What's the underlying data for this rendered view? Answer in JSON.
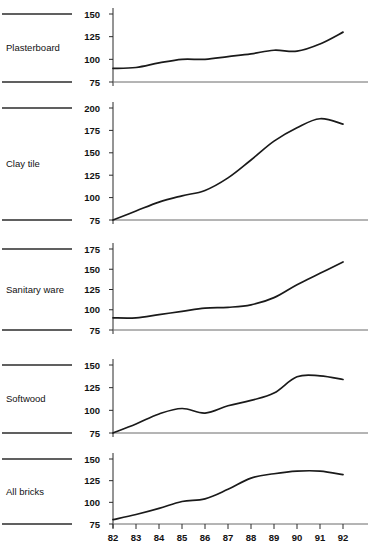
{
  "figure": {
    "background": "#ffffff",
    "line_color": "#1a1a1a",
    "axis_color": "#2b2b2b"
  },
  "axis": {
    "year_ticks": [
      "82",
      "83",
      "84",
      "85",
      "86",
      "87",
      "88",
      "89",
      "90",
      "91",
      "92"
    ]
  },
  "panels": [
    {
      "label": "Plasterboard",
      "yticks": [
        "150",
        "125",
        "100",
        "75"
      ],
      "ymin": 75,
      "ymax": 155
    },
    {
      "label": "Clay tile",
      "yticks": [
        "200",
        "175",
        "150",
        "125",
        "100",
        "75"
      ],
      "ymin": 75,
      "ymax": 205
    },
    {
      "label": "Sanitary ware",
      "yticks": [
        "175",
        "150",
        "125",
        "100",
        "75"
      ],
      "ymin": 75,
      "ymax": 180
    },
    {
      "label": "Softwood",
      "yticks": [
        "150",
        "125",
        "100",
        "75"
      ],
      "ymin": 75,
      "ymax": 155
    },
    {
      "label": "All bricks",
      "yticks": [
        "150",
        "125",
        "100",
        "75"
      ],
      "ymin": 75,
      "ymax": 155
    }
  ],
  "chart_data": {
    "type": "line",
    "title": "",
    "xlabel": "",
    "ylabel": "",
    "grid": false,
    "legend_position": "none",
    "x": [
      82,
      83,
      84,
      85,
      86,
      87,
      88,
      89,
      90,
      91,
      92
    ],
    "panels": [
      {
        "title": "Plasterboard",
        "ylabel": "",
        "ylim": [
          75,
          155
        ],
        "yticks": [
          75,
          100,
          125,
          150
        ],
        "values": [
          90,
          91,
          96,
          100,
          100,
          103,
          106,
          110,
          109,
          117,
          130
        ]
      },
      {
        "title": "Clay tile",
        "ylabel": "",
        "ylim": [
          75,
          205
        ],
        "yticks": [
          75,
          100,
          125,
          150,
          175,
          200
        ],
        "values": [
          75,
          85,
          95,
          102,
          108,
          122,
          142,
          163,
          178,
          188,
          182
        ]
      },
      {
        "title": "Sanitary ware",
        "ylabel": "",
        "ylim": [
          75,
          180
        ],
        "yticks": [
          75,
          100,
          125,
          150,
          175
        ],
        "values": [
          90,
          90,
          94,
          98,
          102,
          103,
          106,
          115,
          131,
          145,
          159
        ]
      },
      {
        "title": "Softwood",
        "ylabel": "",
        "ylim": [
          75,
          155
        ],
        "yticks": [
          75,
          100,
          125,
          150
        ],
        "values": [
          75,
          85,
          96,
          102,
          97,
          105,
          111,
          119,
          137,
          138,
          134
        ]
      },
      {
        "title": "All bricks",
        "ylabel": "",
        "ylim": [
          75,
          155
        ],
        "yticks": [
          75,
          100,
          125,
          150
        ],
        "values": [
          80,
          86,
          93,
          101,
          104,
          115,
          128,
          133,
          136,
          136,
          132
        ]
      }
    ]
  }
}
